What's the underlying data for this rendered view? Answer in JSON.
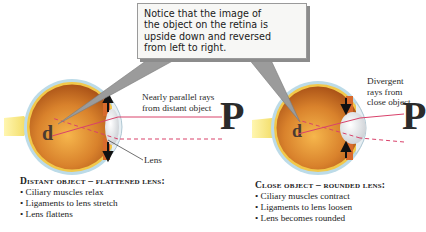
{
  "callout": {
    "lines": [
      "Notice that the image of",
      "the object on the retina is",
      "upside down and reversed",
      "from left to right."
    ]
  },
  "distant": {
    "ray_label_lines": [
      "Nearly parallel rays",
      "from distant object"
    ],
    "lens_label": "Lens",
    "object_glyph": "P",
    "retina_glyph": "d",
    "caption_title": "Distant object – flattened lens:",
    "bullets": [
      "Ciliary muscles relax",
      "Ligaments to lens stretch",
      "Lens flattens"
    ]
  },
  "close": {
    "ray_label_lines": [
      "Divergent",
      "rays from",
      "close object"
    ],
    "object_glyph": "P",
    "retina_glyph": "d",
    "caption_title": "Close object – rounded lens:",
    "bullets": [
      "Ciliary muscles contract",
      "Ligaments to lens loosen",
      "Lens becomes rounded"
    ]
  },
  "colors": {
    "ray": "#d9426b",
    "eye_interior": "#c9651e",
    "eye_highlight": "#f2b24a",
    "sclera": "#a9cfe0",
    "optic_nerve": "#f3e27a",
    "lens": "#e9ecef",
    "callout_pointer": "#8e8e8e"
  }
}
